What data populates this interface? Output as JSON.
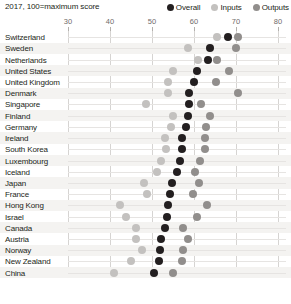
{
  "header": {
    "subtitle": "2017, 100=maximum score"
  },
  "legend": {
    "position": "top-right",
    "items": [
      {
        "label": "Overall",
        "color": "#231f20",
        "key": "overall"
      },
      {
        "label": "Inputs",
        "color": "#c3c1bf",
        "key": "inputs"
      },
      {
        "label": "Outputs",
        "color": "#918e8c",
        "key": "outputs"
      }
    ]
  },
  "axis": {
    "ticks": [
      "30",
      "40",
      "50",
      "60",
      "70",
      "80"
    ],
    "min": 30,
    "max": 80
  },
  "chart_data": {
    "type": "scatter",
    "title": "",
    "subtitle": "2017, 100=maximum score",
    "xlabel": "",
    "ylabel": "",
    "xlim": [
      30,
      80
    ],
    "xticks": [
      30,
      40,
      50,
      60,
      70,
      80
    ],
    "grid": "vertical",
    "legend_position": "top-right",
    "categories": [
      "Switzerland",
      "Sweden",
      "Netherlands",
      "United States",
      "United Kingdom",
      "Denmark",
      "Singapore",
      "Finland",
      "Germany",
      "Ireland",
      "South Korea",
      "Luxembourg",
      "Iceland",
      "Japan",
      "France",
      "Hong Kong",
      "Israel",
      "Canada",
      "Austria",
      "Norway",
      "New Zealand",
      "China"
    ],
    "series": [
      {
        "name": "Overall",
        "color": "#231f20",
        "values": [
          68.0,
          63.8,
          63.3,
          60.6,
          60.1,
          58.7,
          58.7,
          58.5,
          58.0,
          57.2,
          57.1,
          56.6,
          55.9,
          54.7,
          54.2,
          53.7,
          53.6,
          53.0,
          52.2,
          52.0,
          51.6,
          50.5
        ]
      },
      {
        "name": "Inputs",
        "color": "#c3c1bf",
        "values": [
          65.5,
          58.6,
          60.9,
          55.0,
          53.8,
          53.7,
          48.5,
          55.0,
          54.6,
          53.0,
          53.4,
          52.2,
          51.3,
          48.2,
          48.9,
          42.4,
          43.8,
          46.3,
          46.1,
          47.5,
          45.0,
          40.9
        ]
      },
      {
        "name": "Outputs",
        "color": "#918e8c",
        "values": [
          70.5,
          70.0,
          65.5,
          68.3,
          65.2,
          70.4,
          61.7,
          63.9,
          62.8,
          62.5,
          62.6,
          61.4,
          60.2,
          61.3,
          59.8,
          63.2,
          60.6,
          57.4,
          58.5,
          57.3,
          57.2,
          55.1
        ]
      }
    ]
  }
}
